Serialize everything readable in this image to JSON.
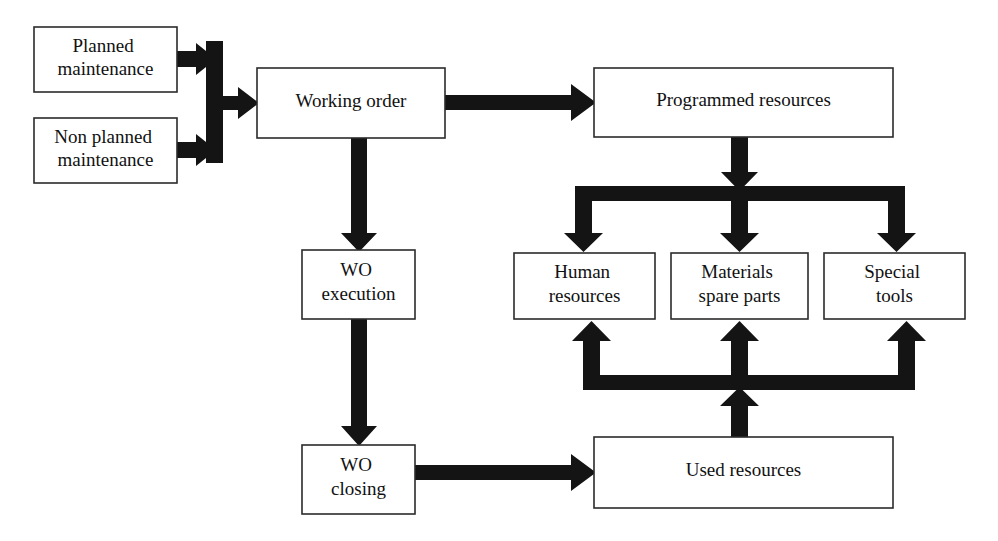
{
  "diagram": {
    "colors": {
      "background": "#ffffff",
      "box_fill": "#ffffff",
      "box_border": "#2b2b2b",
      "arrow": "#141414",
      "text": "#111111"
    },
    "nodes": [
      {
        "id": "planned-maintenance",
        "lines": [
          "Planned",
          "maintenance"
        ],
        "x": 34,
        "y": 27,
        "w": 143,
        "h": 65,
        "font_size": 19
      },
      {
        "id": "non-planned-maintenance",
        "lines": [
          "Non planned",
          "maintenance"
        ],
        "x": 34,
        "y": 118,
        "w": 143,
        "h": 65,
        "font_size": 19
      },
      {
        "id": "working-order",
        "lines": [
          "Working order"
        ],
        "x": 257,
        "y": 68,
        "w": 188,
        "h": 70,
        "font_size": 19
      },
      {
        "id": "programmed-resources",
        "lines": [
          "Programmed resources"
        ],
        "x": 594,
        "y": 68,
        "w": 299,
        "h": 69,
        "font_size": 19
      },
      {
        "id": "wo-execution",
        "lines": [
          "WO",
          "execution"
        ],
        "x": 302,
        "y": 250,
        "w": 113,
        "h": 69,
        "font_size": 19
      },
      {
        "id": "human-resources",
        "lines": [
          "Human",
          "resources"
        ],
        "x": 514,
        "y": 253,
        "w": 141,
        "h": 66,
        "font_size": 19
      },
      {
        "id": "materials-spare-parts",
        "lines": [
          "Materials",
          "spare parts"
        ],
        "x": 671,
        "y": 253,
        "w": 137,
        "h": 66,
        "font_size": 19
      },
      {
        "id": "special-tools",
        "lines": [
          "Special",
          "tools"
        ],
        "x": 824,
        "y": 253,
        "w": 141,
        "h": 66,
        "font_size": 19
      },
      {
        "id": "wo-closing",
        "lines": [
          "WO",
          "closing"
        ],
        "x": 302,
        "y": 445,
        "w": 113,
        "h": 69,
        "font_size": 19
      },
      {
        "id": "used-resources",
        "lines": [
          "Used resources"
        ],
        "x": 594,
        "y": 437,
        "w": 299,
        "h": 71,
        "font_size": 19
      }
    ],
    "edges": [
      {
        "id": "planned-to-merge",
        "from": "planned-maintenance",
        "to": "merge-bar",
        "direction": "right"
      },
      {
        "id": "non-planned-to-merge",
        "from": "non-planned-maintenance",
        "to": "merge-bar",
        "direction": "right"
      },
      {
        "id": "merge-to-working-order",
        "from": "merge-bar",
        "to": "working-order",
        "direction": "right"
      },
      {
        "id": "working-order-to-programmed-resources",
        "from": "working-order",
        "to": "programmed-resources",
        "direction": "right"
      },
      {
        "id": "working-order-to-wo-execution",
        "from": "working-order",
        "to": "wo-execution",
        "direction": "down"
      },
      {
        "id": "programmed-resources-to-split",
        "from": "programmed-resources",
        "to": "split-bar",
        "direction": "down"
      },
      {
        "id": "split-to-human-resources",
        "from": "split-bar",
        "to": "human-resources",
        "direction": "down"
      },
      {
        "id": "split-to-materials-spare-parts",
        "from": "split-bar",
        "to": "materials-spare-parts",
        "direction": "down"
      },
      {
        "id": "split-to-special-tools",
        "from": "split-bar",
        "to": "special-tools",
        "direction": "down"
      },
      {
        "id": "wo-execution-to-wo-closing",
        "from": "wo-execution",
        "to": "wo-closing",
        "direction": "down"
      },
      {
        "id": "wo-closing-to-used-resources",
        "from": "wo-closing",
        "to": "used-resources",
        "direction": "right"
      },
      {
        "id": "used-resources-to-feedback",
        "from": "used-resources",
        "to": "feedback-bar",
        "direction": "up"
      },
      {
        "id": "feedback-to-human-resources",
        "from": "feedback-bar",
        "to": "human-resources",
        "direction": "up"
      },
      {
        "id": "feedback-to-materials-spare-parts",
        "from": "feedback-bar",
        "to": "materials-spare-parts",
        "direction": "up"
      },
      {
        "id": "feedback-to-special-tools",
        "from": "feedback-bar",
        "to": "special-tools",
        "direction": "up"
      }
    ]
  }
}
